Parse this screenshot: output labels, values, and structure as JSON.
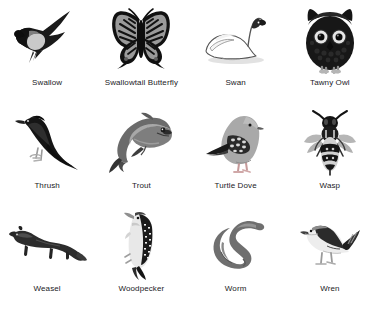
{
  "page": {
    "background_color": "#ffffff",
    "columns": 4,
    "rows": 3
  },
  "style": {
    "caption_color": "#222226",
    "ink_black": "#141414",
    "mid_gray": "#6f6f6f",
    "light_gray": "#b9b9b9",
    "pale_gray": "#d9d9d9",
    "outline_gray": "#8a8a8a"
  },
  "items": [
    {
      "id": "swallow",
      "label": "Swallow",
      "icon": "swallow-illustration"
    },
    {
      "id": "butterfly",
      "label": "Swallowtail Butterfly",
      "icon": "swallowtail-butterfly-illustration"
    },
    {
      "id": "swan",
      "label": "Swan",
      "icon": "swan-illustration"
    },
    {
      "id": "tawny-owl",
      "label": "Tawny Owl",
      "icon": "tawny-owl-illustration"
    },
    {
      "id": "thrush",
      "label": "Thrush",
      "icon": "thrush-illustration"
    },
    {
      "id": "trout",
      "label": "Trout",
      "icon": "trout-illustration"
    },
    {
      "id": "turtle-dove",
      "label": "Turtle Dove",
      "icon": "turtle-dove-illustration"
    },
    {
      "id": "wasp",
      "label": "Wasp",
      "icon": "wasp-illustration"
    },
    {
      "id": "weasel",
      "label": "Weasel",
      "icon": "weasel-illustration"
    },
    {
      "id": "woodpecker",
      "label": "Woodpecker",
      "icon": "woodpecker-illustration"
    },
    {
      "id": "worm",
      "label": "Worm",
      "icon": "worm-illustration"
    },
    {
      "id": "wren",
      "label": "Wren",
      "icon": "wren-illustration"
    }
  ]
}
